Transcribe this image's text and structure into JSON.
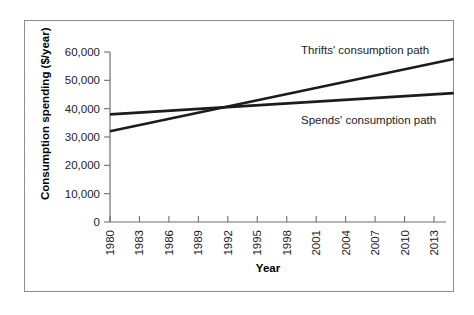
{
  "chart_data": {
    "type": "line",
    "title": "",
    "xlabel": "Year",
    "ylabel": "Consumption spending ($/year)",
    "xlim": [
      1980,
      2016
    ],
    "ylim": [
      0,
      60000
    ],
    "xticks": [
      "1980",
      "1983",
      "1986",
      "1989",
      "1992",
      "1995",
      "1998",
      "2001",
      "2004",
      "2007",
      "2010",
      "2013"
    ],
    "xtick_values": [
      1980,
      1983,
      1986,
      1989,
      1992,
      1995,
      1998,
      2001,
      2004,
      2007,
      2010,
      2013
    ],
    "yticks": [
      "0",
      "10,000",
      "20,000",
      "30,000",
      "40,000",
      "50,000",
      "60,000"
    ],
    "ytick_values": [
      0,
      10000,
      20000,
      30000,
      40000,
      50000,
      60000
    ],
    "grid": false,
    "legend_position": "inline-annotations",
    "series": [
      {
        "name": "Thrifts' consumption path",
        "label": "Thrifts' consumption path",
        "color": "#1c1c1c",
        "x": [
          1980,
          2015
        ],
        "values": [
          32000,
          57500
        ],
        "endpoints": {
          "start_year": 1980,
          "start_value": 32000,
          "end_year": 2015,
          "end_value": 57500
        }
      },
      {
        "name": "Spends' consumption path",
        "label": "Spends' consumption path",
        "color": "#1c1c1c",
        "x": [
          1980,
          2015
        ],
        "values": [
          38000,
          45500
        ],
        "endpoints": {
          "start_year": 1980,
          "start_value": 38000,
          "end_year": 2015,
          "end_value": 45500
        }
      }
    ],
    "annotations": [
      {
        "text": "Thrifts' consumption path",
        "x": 2001,
        "y": 59000
      },
      {
        "text": "Spends' consumption path",
        "x": 2001,
        "y": 37500
      }
    ],
    "crossover": {
      "year": 1995,
      "value": 41000
    }
  },
  "colors": {
    "line": "#1c1c1c",
    "axis": "#6f6f6f",
    "frame": "#8d8d8d",
    "text": "#222222",
    "background": "#ffffff"
  }
}
